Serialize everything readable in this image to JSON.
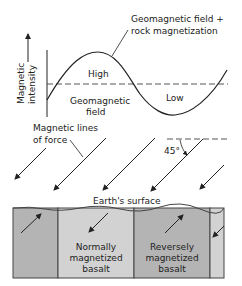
{
  "diagram": {
    "labels": {
      "combined_line_1": "Geomagnetic field +",
      "combined_line_2": "rock magnetization",
      "y_axis_line_1": "Magnetic",
      "y_axis_line_2": "intensity",
      "high": "High",
      "low": "Low",
      "geomagnetic_line_1": "Geomagnetic",
      "geomagnetic_line_2": "field",
      "force_line_1": "Magnetic lines",
      "force_line_2": "of force",
      "angle": "45°",
      "surface": "Earth's surface",
      "normal_line_1": "Normally",
      "normal_line_2": "magnetized",
      "normal_line_3": "basalt",
      "reverse_line_1": "Reversely",
      "reverse_line_2": "magnetized",
      "reverse_line_3": "basalt"
    },
    "colors": {
      "block_dark": "#b4b4b4",
      "block_light": "#d2d2d2",
      "line": "#222222"
    }
  }
}
